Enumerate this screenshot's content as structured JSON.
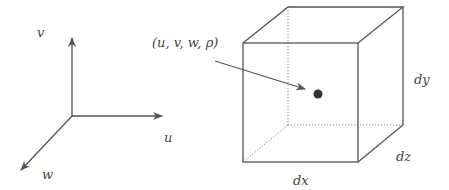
{
  "diagram": {
    "type": "fluid-element-schematic",
    "colors": {
      "line": "#555555",
      "dotted": "#888888",
      "dot": "#333333",
      "text": "#444444"
    },
    "axes": {
      "labels": {
        "v": "v",
        "u": "u",
        "w": "w"
      }
    },
    "point_label": "(u, v, w, ρ)",
    "cube": {
      "labels": {
        "dx": "dx",
        "dy": "dy",
        "dz": "dz"
      }
    }
  }
}
